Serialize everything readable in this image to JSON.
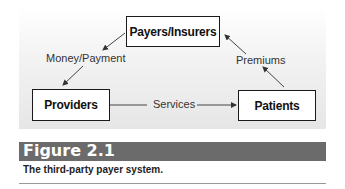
{
  "diagram": {
    "nodes": {
      "payers": "Payers/Insurers",
      "providers": "Providers",
      "patients": "Patients"
    },
    "edges": {
      "money": "Money/Payment",
      "services": "Services",
      "premiums": "Premiums"
    }
  },
  "figure": {
    "label": "Figure 2.1",
    "caption": "The third-party payer system."
  }
}
